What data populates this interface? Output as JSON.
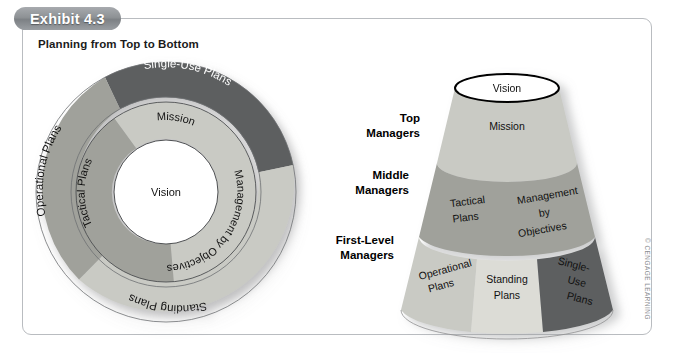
{
  "exhibit": {
    "badge": "Exhibit 4.3",
    "title": "Planning from Top to Bottom",
    "copyright": "© CENGAGE LEARNING"
  },
  "colors": {
    "light_gray": "#c9cac4",
    "pale_gray": "#dcdcd6",
    "mid_gray": "#a0a19b",
    "dark_gray": "#5d5f60",
    "white": "#ffffff",
    "outline": "#4a4a4a",
    "badge_gray": "#8e9295",
    "panel_border": "#b9bcc0"
  },
  "circle_diagram": {
    "name": "concentric-planning-circle",
    "center_label": "Vision",
    "inner_ring": [
      {
        "label": "Mission",
        "color": "#c9cac4"
      },
      {
        "label": "Management by Objectives",
        "color": "#c9cac4"
      },
      {
        "label": "Tactical Plans",
        "color": "#a0a19b"
      }
    ],
    "outer_ring": [
      {
        "label": "Single-Use Plans",
        "color": "#5d5f60"
      },
      {
        "label": "Standing Plans",
        "color": "#c9cac4"
      },
      {
        "label": "Operational Plans",
        "color": "#a0a19b"
      }
    ]
  },
  "cone_diagram": {
    "name": "planning-cone",
    "top_label": "Vision",
    "manager_levels": [
      {
        "line1": "Top",
        "line2": "Managers"
      },
      {
        "line1": "Middle",
        "line2": "Managers"
      },
      {
        "line1": "First-Level",
        "line2": "Managers"
      }
    ],
    "bands": [
      {
        "level": "top",
        "segments": [
          {
            "lines": [
              "Mission"
            ],
            "color": "#c9cac4"
          }
        ]
      },
      {
        "level": "middle",
        "segments": [
          {
            "lines": [
              "Tactical",
              "Plans"
            ],
            "color": "#a0a19b"
          },
          {
            "lines": [
              "Management",
              "by",
              "Objectives"
            ],
            "color": "#a0a19b"
          }
        ]
      },
      {
        "level": "first",
        "segments": [
          {
            "lines": [
              "Operational",
              "Plans"
            ],
            "color": "#c9cac4"
          },
          {
            "lines": [
              "Standing",
              "Plans"
            ],
            "color": "#dcdcd6"
          },
          {
            "lines": [
              "Single-",
              "Use",
              "Plans"
            ],
            "color": "#5d5f60"
          }
        ]
      }
    ]
  }
}
